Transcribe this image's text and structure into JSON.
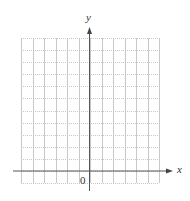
{
  "chart_data": {
    "type": "scatter",
    "title": "",
    "xlabel": "x",
    "ylabel": "y",
    "origin_label": "0",
    "grid": true,
    "grid_style": {
      "vertical": "solid",
      "horizontal": "dotted",
      "color": "#c8c8c8"
    },
    "axis_color": "#555555",
    "x_grid_cells": {
      "left_of_y_axis": 6,
      "right_of_y_axis": 6
    },
    "y_grid_cells": {
      "above_x_axis": 11,
      "below_x_axis": 1
    },
    "xlim": [
      -6,
      6
    ],
    "ylim": [
      -1,
      11
    ],
    "series": [],
    "legend": null
  },
  "labels": {
    "x_axis": "x",
    "y_axis": "y",
    "origin": "0"
  }
}
